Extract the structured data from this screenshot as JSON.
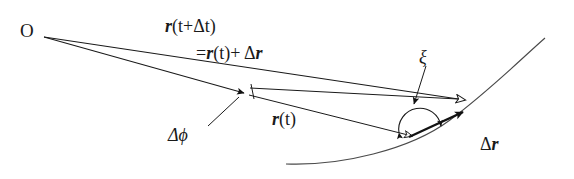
{
  "figure": {
    "background_color": "#ffffff",
    "stroke_color": "#1a1a1a",
    "width": 574,
    "height": 179,
    "labels": {
      "origin": "O",
      "r_t_plus_dt": {
        "vec": "r",
        "args": "(t+Δt)"
      },
      "r_sum": {
        "eq": "=",
        "vec1": "r",
        "arg1": "(t)",
        "plus": "+ Δ",
        "vec2": "r"
      },
      "r_t": {
        "vec": "r",
        "args": "(t)"
      },
      "delta_phi": "Δϕ",
      "xi": "ξ",
      "delta_r": {
        "delta": "Δ",
        "vec": "r"
      }
    },
    "elements": {
      "origin_point": "O",
      "vector_r_t": "r(t)",
      "vector_r_t_plus_delta_t": "r(t+Δt)",
      "vector_delta_r": "Δr",
      "angle_delta_phi": "Δϕ",
      "angle_xi": "ξ",
      "trajectory_curve": "particle path"
    }
  }
}
